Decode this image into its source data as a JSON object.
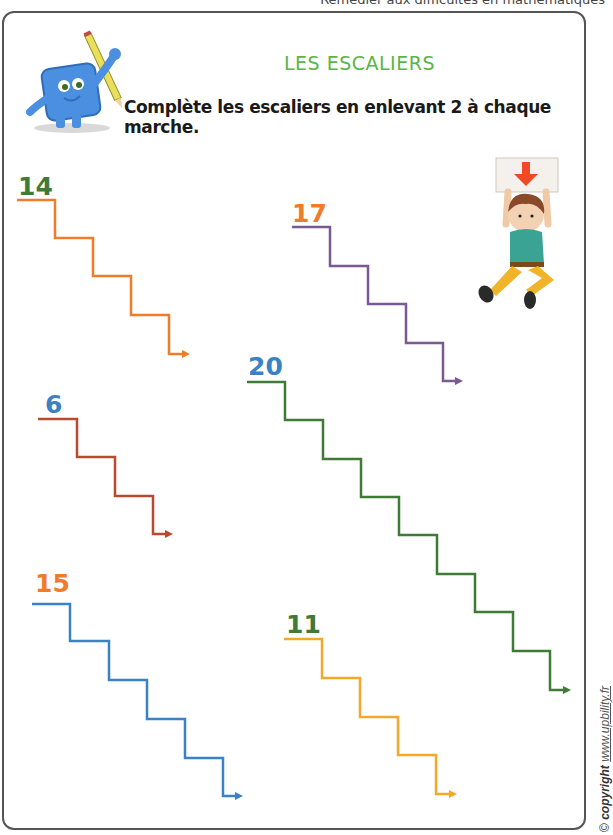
{
  "header": {
    "subtitle": "Remédier aux difficultés en mathématiques"
  },
  "worksheet": {
    "title": "LES ESCALIERS",
    "instruction": "Complète les escaliers en enlevant 2 à chaque marche.",
    "colors": {
      "title": "#5ab548",
      "frame": "#555555"
    }
  },
  "illustrations": {
    "mascot": "blue-square-mascot-holding-pencil",
    "kid": "child-holding-down-arrow-sign"
  },
  "staircases": [
    {
      "start": "14",
      "steps": 4,
      "number_color": "#3f7a36",
      "line_color": "#f07c2a"
    },
    {
      "start": "17",
      "steps": 4,
      "number_color": "#f07c2a",
      "line_color": "#7b5a94"
    },
    {
      "start": "6",
      "steps": 3,
      "number_color": "#3a82c4",
      "line_color": "#b94a2e"
    },
    {
      "start": "20",
      "steps": 8,
      "number_color": "#3a82c4",
      "line_color": "#3f7a36"
    },
    {
      "start": "15",
      "steps": 5,
      "number_color": "#f07c2a",
      "line_color": "#3a82c4"
    },
    {
      "start": "11",
      "steps": 4,
      "number_color": "#3f7a36",
      "line_color": "#f2a928"
    }
  ],
  "footer": {
    "copyright_symbol": "©",
    "copyright_label": "copyright",
    "url": "www.upbility.fr"
  }
}
